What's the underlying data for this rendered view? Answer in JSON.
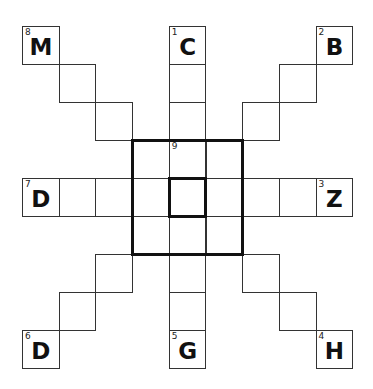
{
  "puzzle": {
    "grid_size": 9,
    "layout": {
      "x0": 22,
      "y0": 26,
      "cell_w": 36.7,
      "cell_h": 38
    },
    "cells": [
      {
        "r": 0,
        "c": 0,
        "num": "8",
        "letter": "M"
      },
      {
        "r": 1,
        "c": 1
      },
      {
        "r": 2,
        "c": 2
      },
      {
        "r": 0,
        "c": 4,
        "num": "1",
        "letter": "C"
      },
      {
        "r": 1,
        "c": 4
      },
      {
        "r": 2,
        "c": 4
      },
      {
        "r": 0,
        "c": 8,
        "num": "2",
        "letter": "B"
      },
      {
        "r": 1,
        "c": 7
      },
      {
        "r": 2,
        "c": 6
      },
      {
        "r": 3,
        "c": 3
      },
      {
        "r": 3,
        "c": 4,
        "num": "9"
      },
      {
        "r": 3,
        "c": 5
      },
      {
        "r": 4,
        "c": 0,
        "num": "7",
        "letter": "D"
      },
      {
        "r": 4,
        "c": 1
      },
      {
        "r": 4,
        "c": 2
      },
      {
        "r": 4,
        "c": 3
      },
      {
        "r": 4,
        "c": 4
      },
      {
        "r": 4,
        "c": 5
      },
      {
        "r": 4,
        "c": 6
      },
      {
        "r": 4,
        "c": 7
      },
      {
        "r": 4,
        "c": 8,
        "num": "3",
        "letter": "Z"
      },
      {
        "r": 5,
        "c": 3
      },
      {
        "r": 5,
        "c": 4
      },
      {
        "r": 5,
        "c": 5
      },
      {
        "r": 6,
        "c": 2
      },
      {
        "r": 6,
        "c": 4
      },
      {
        "r": 6,
        "c": 6
      },
      {
        "r": 7,
        "c": 1
      },
      {
        "r": 7,
        "c": 4
      },
      {
        "r": 7,
        "c": 7
      },
      {
        "r": 8,
        "c": 0,
        "num": "6",
        "letter": "D"
      },
      {
        "r": 8,
        "c": 4,
        "num": "5",
        "letter": "G"
      },
      {
        "r": 8,
        "c": 8,
        "num": "4",
        "letter": "H"
      }
    ],
    "thick_boxes": [
      {
        "r": 3,
        "c": 3,
        "rows": 3,
        "cols": 3
      },
      {
        "r": 4,
        "c": 4,
        "rows": 1,
        "cols": 1
      }
    ]
  }
}
